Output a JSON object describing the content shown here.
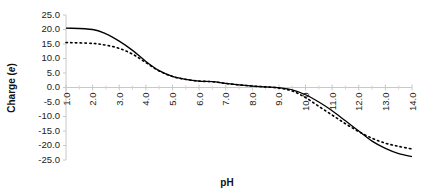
{
  "chart_data": {
    "type": "line",
    "title": "",
    "xlabel": "pH",
    "ylabel": "Charge (e)",
    "ylabel_parts": {
      "prefix": "Charge (",
      "italic": "e",
      "suffix": ")"
    },
    "xlim": [
      1.0,
      14.0
    ],
    "ylim": [
      -25.0,
      25.0
    ],
    "grid": false,
    "legend": "none",
    "x_ticks": [
      "1.0",
      "2.0",
      "3.0",
      "4.0",
      "5.0",
      "6.0",
      "7.0",
      "8.0",
      "9.0",
      "10.0",
      "11.0",
      "12.0",
      "13.0",
      "14.0"
    ],
    "y_ticks": [
      "25.0",
      "20.0",
      "15.0",
      "10.0",
      "5.0",
      "0.0",
      "-5.0",
      "-10.0",
      "-15.0",
      "-20.0",
      "-25.0"
    ],
    "x": [
      1.0,
      2.0,
      2.5,
      3.0,
      3.5,
      4.0,
      4.5,
      5.0,
      5.5,
      6.0,
      6.5,
      7.0,
      7.5,
      8.0,
      8.5,
      9.0,
      9.5,
      10.0,
      10.5,
      11.0,
      11.5,
      12.0,
      12.5,
      13.0,
      13.5,
      14.0
    ],
    "series": [
      {
        "name": "solid",
        "style": "solid",
        "color": "#000000",
        "values": [
          20.5,
          20.0,
          18.5,
          16.0,
          12.8,
          9.0,
          5.8,
          3.8,
          2.8,
          2.2,
          2.0,
          1.4,
          0.9,
          0.5,
          0.2,
          -0.1,
          -0.8,
          -2.5,
          -5.0,
          -8.0,
          -11.5,
          -15.0,
          -18.5,
          -21.0,
          -22.8,
          -23.8
        ]
      },
      {
        "name": "dotted",
        "style": "dotted",
        "color": "#000000",
        "values": [
          15.5,
          15.2,
          14.6,
          13.5,
          11.5,
          8.6,
          5.7,
          3.8,
          2.8,
          2.2,
          2.0,
          1.4,
          0.9,
          0.5,
          0.2,
          -0.2,
          -1.2,
          -3.5,
          -6.5,
          -9.5,
          -12.5,
          -15.2,
          -17.5,
          -19.2,
          -20.3,
          -21.2
        ]
      }
    ]
  }
}
